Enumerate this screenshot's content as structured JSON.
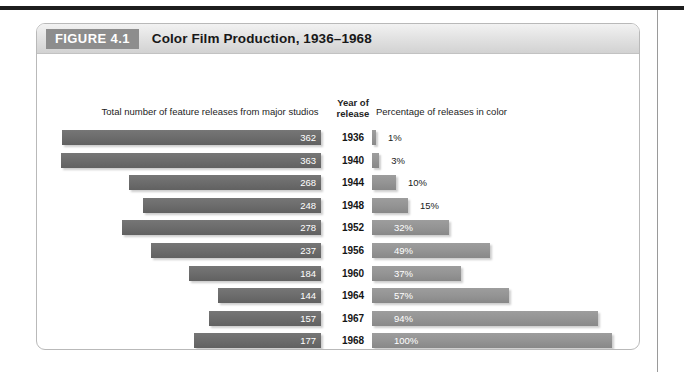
{
  "figure": {
    "number_label": "FIGURE 4.1",
    "title": "Color Film Production, 1936–1968"
  },
  "headers": {
    "left": "Total number of feature releases from major studios",
    "year_line1": "Year of",
    "year_line2": "release",
    "right": "Percentage of releases in color"
  },
  "colors": {
    "bar_left": "#6c6c6c",
    "bar_right": "#949494",
    "header_tab": "#8d8d8d",
    "figure_border": "#b9b9b9"
  },
  "chart_data": {
    "type": "bar",
    "title": "Color Film Production, 1936–1968",
    "orientation": "horizontal",
    "categories": [
      "1936",
      "1940",
      "1944",
      "1948",
      "1952",
      "1956",
      "1960",
      "1964",
      "1967",
      "1968"
    ],
    "xlabel": "",
    "ylabel": "Year of release",
    "grid": false,
    "legend": "none",
    "series": [
      {
        "name": "Total number of feature releases from major studios",
        "direction": "right-to-left",
        "unit": "releases",
        "axis_max": 363,
        "values": [
          362,
          363,
          268,
          248,
          278,
          237,
          184,
          144,
          157,
          177
        ],
        "labels": [
          "362",
          "363",
          "268",
          "248",
          "278",
          "237",
          "184",
          "144",
          "157",
          "177"
        ]
      },
      {
        "name": "Percentage of releases in color",
        "direction": "left-to-right",
        "unit": "percent",
        "axis_max": 100,
        "values": [
          1,
          3,
          10,
          15,
          32,
          49,
          37,
          57,
          94,
          100
        ],
        "labels": [
          "1%",
          "3%",
          "10%",
          "15%",
          "32%",
          "49%",
          "37%",
          "57%",
          "94%",
          "100%"
        ]
      }
    ]
  }
}
